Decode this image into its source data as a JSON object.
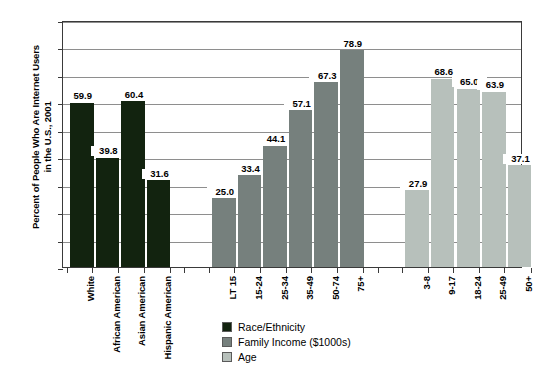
{
  "chart_data": {
    "type": "bar",
    "title": "",
    "xlabel": "",
    "ylabel_line1": "Percent of People Who Are Internet Users",
    "ylabel_line2": "in the U.S., 2001",
    "ylim": [
      0,
      90
    ],
    "ytick_step": 10,
    "yticks": [
      "0",
      "10",
      "20",
      "30",
      "40",
      "50",
      "60",
      "70",
      "80",
      "90"
    ],
    "grid": true,
    "legend_position": "bottom-center",
    "categories": [
      "White",
      "African American",
      "Asian American",
      "Hispanic American",
      "LT 15",
      "15-24",
      "25-34",
      "35-49",
      "50-74",
      "75+",
      "3-8",
      "9-17",
      "18-24",
      "25-49",
      "50+"
    ],
    "values": [
      59.9,
      39.8,
      60.4,
      31.6,
      25.0,
      33.4,
      44.1,
      57.1,
      67.3,
      78.9,
      27.9,
      68.6,
      65.0,
      63.9,
      37.1
    ],
    "groups": [
      {
        "name": "Race/Ethnicity",
        "color": "#12230f",
        "categories": [
          "White",
          "African American",
          "Asian American",
          "Hispanic American"
        ],
        "values": [
          59.9,
          39.8,
          60.4,
          31.6
        ]
      },
      {
        "name": "Family Income ($1000s)",
        "color": "#76807d",
        "categories": [
          "LT 15",
          "15-24",
          "25-34",
          "35-49",
          "50-74",
          "75+"
        ],
        "values": [
          25.0,
          33.4,
          44.1,
          57.1,
          67.3,
          78.9
        ]
      },
      {
        "name": "Age",
        "color": "#b7c0bb",
        "categories": [
          "3-8",
          "9-17",
          "18-24",
          "25-49",
          "50+"
        ],
        "values": [
          27.9,
          68.6,
          65.0,
          63.9,
          37.1
        ]
      }
    ],
    "value_labels": [
      "59.9",
      "39.8",
      "60.4",
      "31.6",
      "25.0",
      "33.4",
      "44.1",
      "57.1",
      "67.3",
      "78.9",
      "27.9",
      "68.6",
      "65.0",
      "63.9",
      "37.1"
    ],
    "legend": [
      {
        "label": "Race/Ethnicity",
        "color": "#12230f"
      },
      {
        "label": "Family Income ($1000s)",
        "color": "#76807d"
      },
      {
        "label": "Age",
        "color": "#b7c0bb"
      }
    ]
  }
}
